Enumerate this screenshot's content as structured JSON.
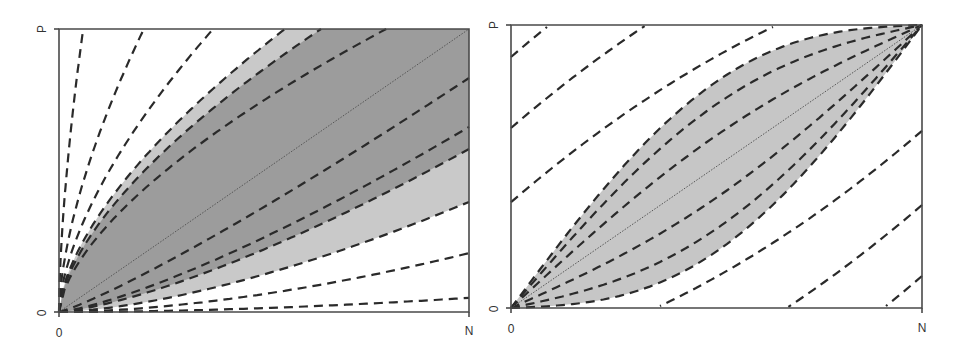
{
  "chart_data": [
    {
      "type": "area",
      "panel": "left",
      "title": "",
      "xlabel": "",
      "ylabel": "",
      "x_ticks": [
        "0",
        "N"
      ],
      "y_ticks": [
        "0",
        "P"
      ],
      "xlim": [
        0,
        1
      ],
      "ylim": [
        0,
        1
      ],
      "grid": false,
      "colors": {
        "dark_band": "#9c9c9c",
        "light_band": "#c9c9c9",
        "curve": "#2a2a2a"
      },
      "description": "Fan of dashed isoline curves from origin; shaded dark band with light margins around diagonal",
      "curves_top_intercepts_x": [
        0.059,
        0.207,
        0.376,
        0.551,
        0.639,
        0.798
      ],
      "curves_right_intercepts_y": [
        0.827,
        0.654,
        0.576,
        0.389,
        0.208,
        0.05
      ],
      "diagonal": true,
      "light_band": {
        "upper_top_x": 0.551,
        "lower_right_y": 0.389
      },
      "dark_band": {
        "upper_top_x": 0.639,
        "lower_right_y": 0.576
      }
    },
    {
      "type": "area",
      "panel": "right",
      "title": "",
      "xlabel": "",
      "ylabel": "",
      "x_ticks": [
        "0",
        "N"
      ],
      "y_ticks": [
        "0",
        "P"
      ],
      "xlim": [
        0,
        1
      ],
      "ylim": [
        0,
        1
      ],
      "grid": false,
      "colors": {
        "band": "#c6c6c6",
        "curve": "#2a2a2a"
      },
      "description": "Lens-shaped shaded region around diagonal with dashed isolines; point-symmetric",
      "outer_curves_left_intercepts_y": [
        0.887,
        0.636,
        0.374
      ],
      "outer_curves_bottom_intercepts_x": [
        0.41,
        0.67,
        0.913
      ],
      "lens_bulge": [
        0.3,
        0.22,
        0.11
      ],
      "diagonal": true
    }
  ],
  "labels": {
    "left": {
      "x0": "0",
      "xN": "N",
      "y0": "0",
      "yP": "P"
    },
    "right": {
      "x0": "0",
      "xN": "N",
      "y0": "0",
      "yP": "P"
    }
  }
}
